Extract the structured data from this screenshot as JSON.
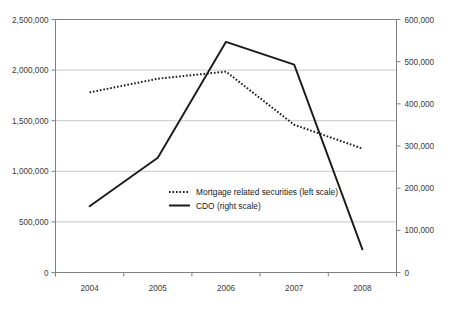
{
  "chart_data": {
    "type": "line",
    "title": "",
    "subtitle": "",
    "xlabel": "",
    "ylabel": "",
    "grid": true,
    "legend_position": "center",
    "categories": [
      "2004",
      "2005",
      "2006",
      "2007",
      "2008"
    ],
    "x_tick_labels": [
      "2004",
      "2005",
      "2006",
      "2007",
      "2008"
    ],
    "axes": [
      {
        "id": "left",
        "name": "left scale",
        "ylim": [
          0,
          2500000
        ],
        "ticks": [
          0,
          500000,
          1000000,
          1500000,
          2000000,
          2500000
        ],
        "tick_labels": [
          "0",
          "500,000",
          "1,000,000",
          "1,500,000",
          "2,000,000",
          "2,500,000"
        ]
      },
      {
        "id": "right",
        "name": "right scale",
        "ylim": [
          0,
          600000
        ],
        "ticks": [
          0,
          100000,
          200000,
          300000,
          400000,
          500000,
          600000
        ],
        "tick_labels": [
          "0",
          "100,000",
          "200,000",
          "300,000",
          "400,000",
          "500,000",
          "600,000"
        ]
      }
    ],
    "series": [
      {
        "name": "Mortgage related securities (left scale)",
        "short_name": "Mortgage related securities",
        "axis": "left",
        "style": "dotted",
        "color": "#1a1a1a",
        "values": [
          1780000,
          1915000,
          1985000,
          1460000,
          1225000
        ]
      },
      {
        "name": "CDO (right scale)",
        "short_name": "CDO",
        "axis": "right",
        "style": "solid",
        "color": "#1a1a1a",
        "values": [
          157000,
          272000,
          547000,
          493000,
          55000
        ]
      }
    ],
    "legend": [
      {
        "label": "Mortgage related securities (left scale)",
        "style": "dotted"
      },
      {
        "label": "CDO (right scale)",
        "style": "solid"
      }
    ]
  },
  "colors": {
    "axis": "#808080",
    "grid": "#c8c8c8",
    "line": "#1a1a1a",
    "text": "#3b3b3b",
    "background": "#ffffff"
  }
}
